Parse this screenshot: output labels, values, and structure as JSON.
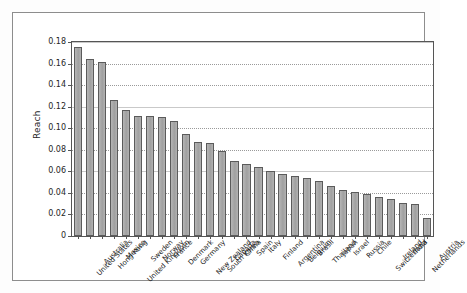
{
  "chart_data": {
    "type": "bar",
    "title": "",
    "xlabel": "",
    "ylabel": "Reach",
    "ylim": [
      0,
      0.18
    ],
    "grid": true,
    "legend": "none",
    "ytick_labels": [
      "0",
      "0.02",
      "0.04",
      "0.06",
      "0.08",
      "0.10",
      "0.12",
      "0.14",
      "0.16",
      "0.18"
    ],
    "ytick_values": [
      0,
      0.02,
      0.04,
      0.06,
      0.08,
      0.1,
      0.12,
      0.14,
      0.16,
      0.18
    ],
    "categories": [
      "United States",
      "Australia",
      "Hong Kong",
      "Mexico",
      "United Kingdom",
      "Sweden",
      "Norway",
      "France",
      "Denmark",
      "Germany",
      "New Zealand",
      "South Korea",
      "Canada",
      "China",
      "Spain",
      "Italy",
      "Finland",
      "Argentina",
      "Belgium",
      "Brasil",
      "Thailand",
      "Japan",
      "Israel",
      "Russia",
      "Chile",
      "Switzerland",
      "Ireland",
      "India",
      "Netherlands",
      "Austria"
    ],
    "values": [
      0.175,
      0.164,
      0.161,
      0.126,
      0.117,
      0.111,
      0.111,
      0.11,
      0.107,
      0.095,
      0.087,
      0.086,
      0.079,
      0.07,
      0.067,
      0.064,
      0.06,
      0.058,
      0.056,
      0.054,
      0.051,
      0.046,
      0.043,
      0.041,
      0.039,
      0.036,
      0.034,
      0.031,
      0.03,
      0.017
    ],
    "colors": {
      "bar_fill": "#a9a9a9",
      "bar_edge": "#5b5b5b",
      "grid": "#9a9a9a",
      "axis": "#555555",
      "background": "#ffffff"
    }
  }
}
